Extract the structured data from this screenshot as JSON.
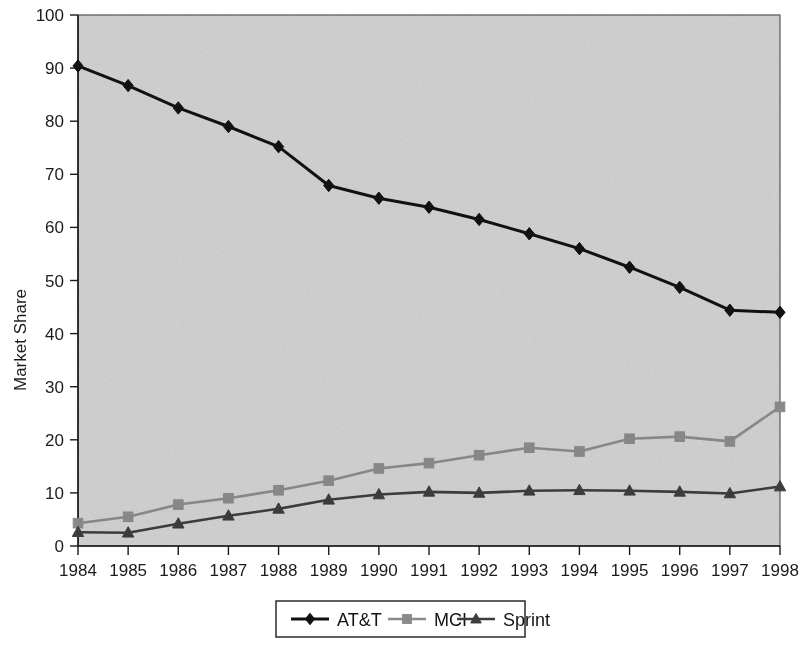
{
  "chart_data": {
    "type": "line",
    "title": "",
    "subtitle": "",
    "xlabel": "",
    "ylabel": "Market Share",
    "categories": [
      "1984",
      "1985",
      "1986",
      "1987",
      "1988",
      "1989",
      "1990",
      "1991",
      "1992",
      "1993",
      "1994",
      "1995",
      "1996",
      "1997",
      "1998"
    ],
    "x": [
      1984,
      1985,
      1986,
      1987,
      1988,
      1989,
      1990,
      1991,
      1992,
      1993,
      1994,
      1995,
      1996,
      1997,
      1998
    ],
    "xlim": [
      1984,
      1998
    ],
    "ylim": [
      0,
      100
    ],
    "yticks": [
      0,
      10,
      20,
      30,
      40,
      50,
      60,
      70,
      80,
      90,
      100
    ],
    "ytick_labels": [
      "0",
      "10",
      "20",
      "30",
      "40",
      "50",
      "60",
      "70",
      "80",
      "90",
      "100"
    ],
    "grid": false,
    "legend_position": "bottom",
    "plot_background": "#d2d2d2",
    "figure_background": "#ffffff",
    "series": [
      {
        "name": "AT&T",
        "color": "#111111",
        "marker": "diamond",
        "values": [
          90.4,
          86.7,
          82.5,
          79.0,
          75.2,
          67.9,
          65.5,
          63.8,
          61.5,
          58.8,
          56.0,
          52.5,
          48.7,
          44.4,
          44.0
        ]
      },
      {
        "name": "MCI",
        "color": "#8a8a8a",
        "marker": "square",
        "values": [
          4.3,
          5.5,
          7.8,
          9.0,
          10.5,
          12.3,
          14.6,
          15.6,
          17.1,
          18.5,
          17.8,
          20.2,
          20.6,
          19.7,
          26.2
        ]
      },
      {
        "name": "Sprint",
        "color": "#3d3d3d",
        "marker": "triangle",
        "values": [
          2.6,
          2.5,
          4.2,
          5.7,
          7.0,
          8.7,
          9.7,
          10.2,
          10.0,
          10.4,
          10.5,
          10.4,
          10.2,
          9.9,
          11.2
        ]
      }
    ]
  },
  "legend": {
    "entries": [
      {
        "label": "AT&T"
      },
      {
        "label": "MCI"
      },
      {
        "label": "Sprint"
      }
    ]
  }
}
